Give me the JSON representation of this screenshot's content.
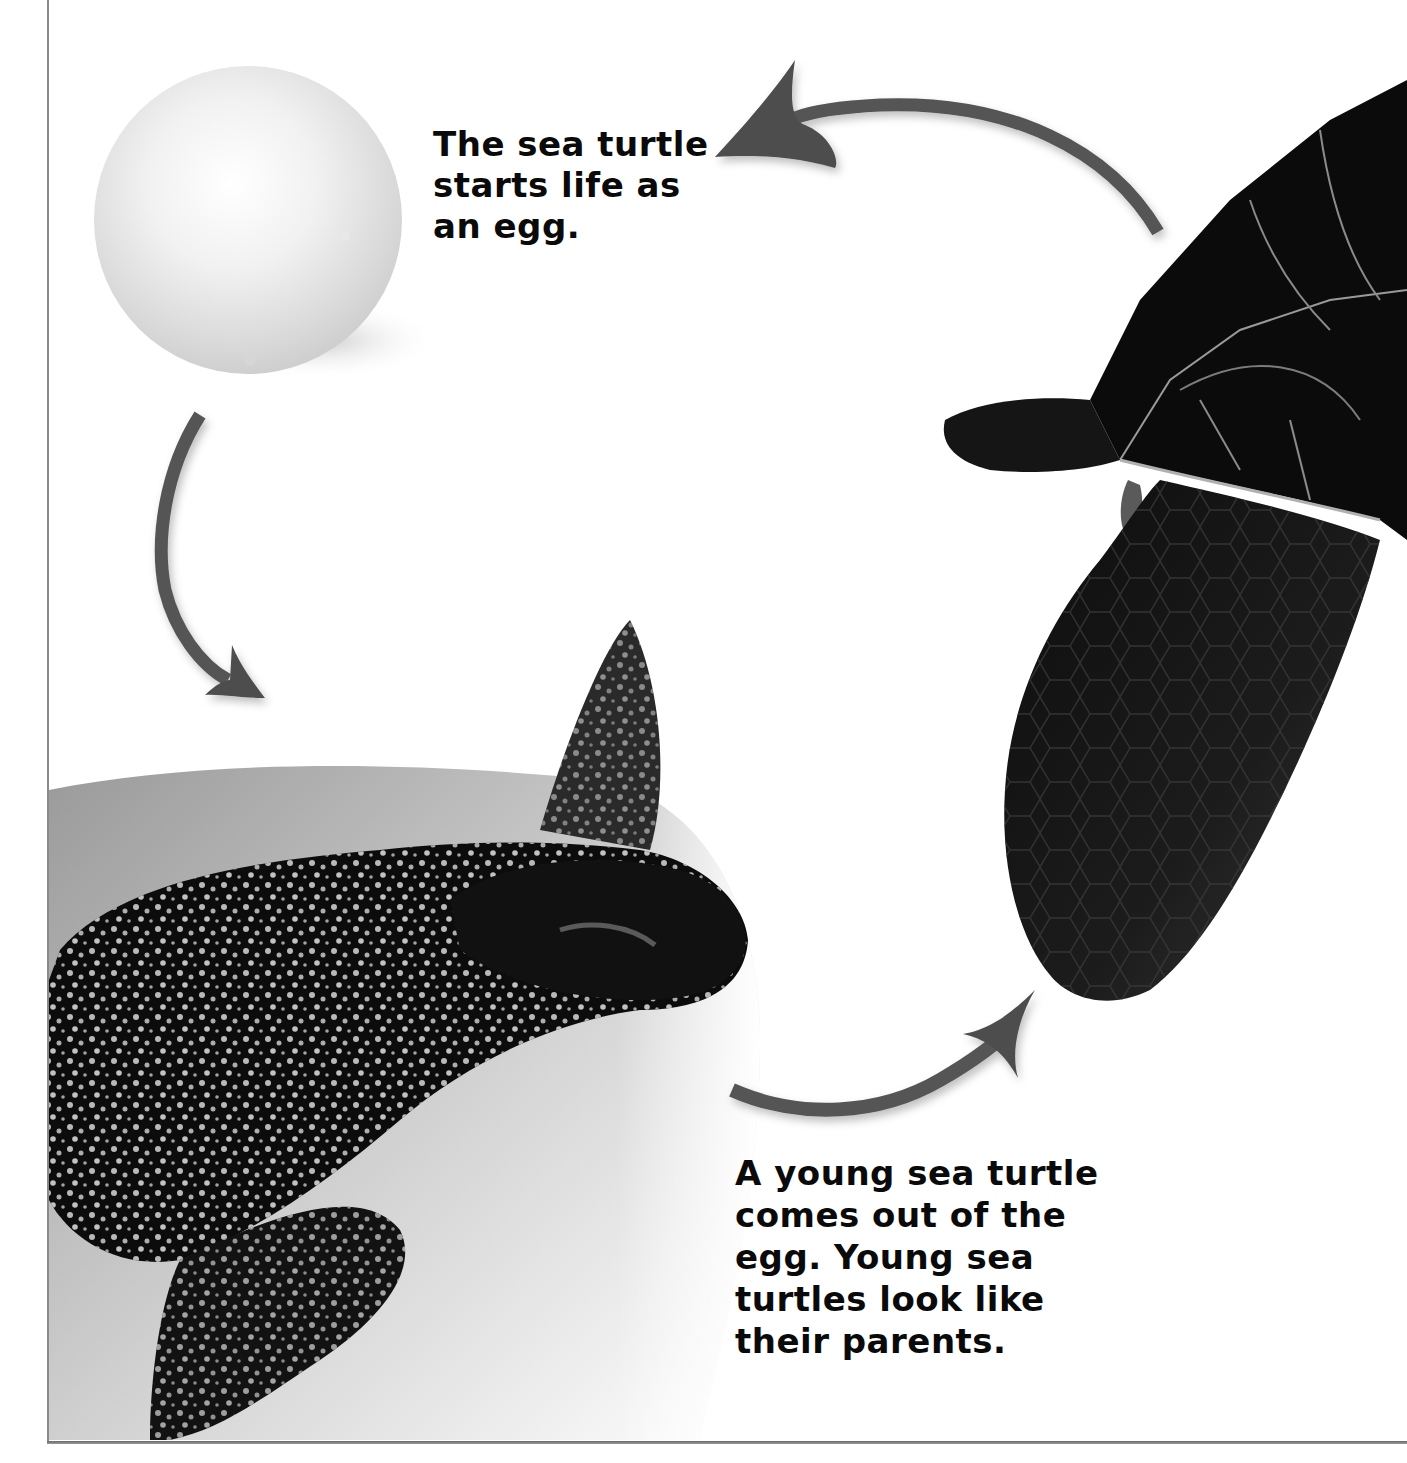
{
  "page": {
    "background_color": "#ffffff",
    "text_color": "#0a0a0a",
    "arrow_color": "#555555"
  },
  "stages": [
    {
      "id": "egg",
      "image_label": "sea turtle egg",
      "caption_lines": [
        "The sea turtle",
        "starts life as",
        "an egg."
      ]
    },
    {
      "id": "hatchling",
      "image_label": "young sea turtle in sand",
      "caption_lines": [
        "A young sea turtle",
        "comes out of the",
        "egg. Young sea",
        "turtles look like",
        "their parents."
      ]
    },
    {
      "id": "adult",
      "image_label": "adult sea turtle",
      "caption_lines": []
    }
  ],
  "arrows": [
    {
      "from": "egg",
      "to": "hatchling",
      "icon": "curved-arrow-down"
    },
    {
      "from": "hatchling",
      "to": "adult",
      "icon": "curved-arrow-up-right"
    },
    {
      "from": "adult",
      "to": "egg",
      "icon": "curved-arrow-left"
    }
  ]
}
